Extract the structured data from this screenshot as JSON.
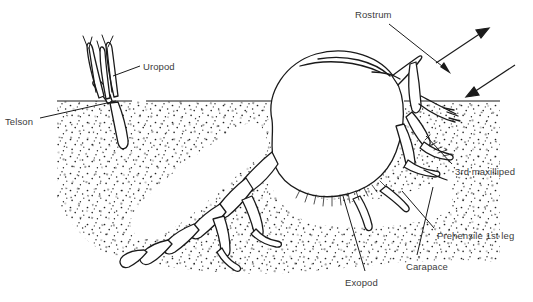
{
  "figure": {
    "background_color": "#ffffff",
    "ink_color": "#1a1a1a",
    "label_color": "#3b3b3b",
    "width": 533,
    "height": 302
  },
  "labels": [
    {
      "id": "rostrum",
      "text": "Rostrum",
      "x": 355,
      "y": 9
    },
    {
      "id": "uropod",
      "text": "Uropod",
      "x": 143,
      "y": 61
    },
    {
      "id": "telson",
      "text": "Telson",
      "x": 5,
      "y": 116
    },
    {
      "id": "third_maxilliped",
      "text": "3rd maxilliped",
      "x": 455,
      "y": 166
    },
    {
      "id": "prehensile_1st_leg",
      "text": "Prehensile 1st leg",
      "x": 437,
      "y": 230
    },
    {
      "id": "carapace",
      "text": "Carapace",
      "x": 406,
      "y": 261
    },
    {
      "id": "exopod",
      "text": "Exopod",
      "x": 345,
      "y": 277
    }
  ],
  "leader_lines": [
    {
      "id": "rostrum-leader",
      "from_label": "Rostrum",
      "points": "390,24 448,70"
    },
    {
      "id": "uropod-leader",
      "from_label": "Uropod",
      "points": "139,66 113,76"
    },
    {
      "id": "telson-leader",
      "from_label": "Telson",
      "points": "40,118 116,101"
    },
    {
      "id": "third-maxilliped-leader",
      "from_label": "3rd maxilliped",
      "points": "452,164 427,137"
    },
    {
      "id": "prehensile-leader",
      "from_label": "Prehensile 1st leg",
      "points": "434,229 403,192"
    },
    {
      "id": "carapace-leader",
      "from_label": "Carapace",
      "points": "417,255 432,188"
    },
    {
      "id": "exopod-leader",
      "from_label": "Exopod",
      "points": "364,272 343,196"
    }
  ],
  "flow_arrows": [
    {
      "id": "exhalant-current",
      "direction": "up-right",
      "points": "436,63 487,29",
      "description": "exhalant water current leaving burrow"
    },
    {
      "id": "inhalant-current",
      "direction": "down-left",
      "points": "515,65 467,97",
      "description": "inhalant water current entering burrow"
    }
  ],
  "scene": {
    "sediment_surface_label": "sediment surface line",
    "sediment_fill": "stippled",
    "sediment_line_y": 101,
    "animal": "burrowing mud shrimp (thalassinidean), head-up in burrow"
  }
}
